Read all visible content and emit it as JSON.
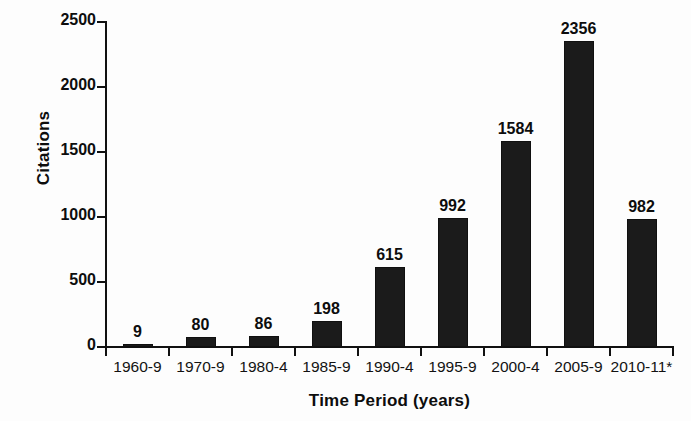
{
  "chart_data": {
    "type": "bar",
    "title": "",
    "xlabel": "Time Period (years)",
    "ylabel": "Citations",
    "categories": [
      "1960-9",
      "1970-9",
      "1980-4",
      "1985-9",
      "1990-4",
      "1995-9",
      "2000-4",
      "2005-9",
      "2010-11*"
    ],
    "values": [
      9,
      80,
      86,
      198,
      615,
      992,
      1584,
      2356,
      982
    ],
    "value_labels": [
      "9",
      "80",
      "86",
      "198",
      "615",
      "992",
      "1584",
      "2356",
      "982"
    ],
    "ylim": [
      0,
      2500
    ],
    "yticks": [
      0,
      500,
      1000,
      1500,
      2000,
      2500
    ],
    "ytick_labels": [
      "0",
      "500",
      "1000",
      "1500",
      "2000",
      "2500"
    ],
    "grid": false,
    "legend": false,
    "bar_color": "#1b1b1b",
    "axis_color": "#111111",
    "background": "#ffffff"
  }
}
